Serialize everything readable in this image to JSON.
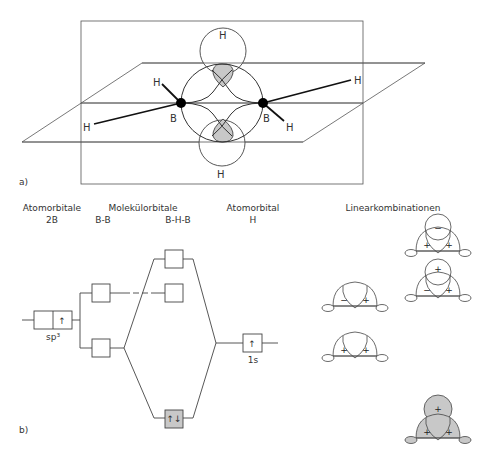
{
  "part_a": {
    "label": "a)",
    "atoms": {
      "boron_left": "B",
      "boron_right": "B",
      "h_bridge_top": "H",
      "h_bridge_bottom": "H",
      "h_terminal_left_upper": "H",
      "h_terminal_left_lower": "H",
      "h_terminal_right_upper": "H",
      "h_terminal_right_lower": "H"
    }
  },
  "part_b": {
    "label": "b)",
    "headers": {
      "atomorbitale": "Atomorbitale",
      "atomorbitale_sub": "2B",
      "molekuelorbitale": "Molekülorbitale",
      "mo_bb": "B-B",
      "mo_bhb": "B-H-B",
      "atomorbital": "Atomorbital",
      "atomorbital_sub": "H",
      "linearkombinationen": "Linearkombinationen"
    },
    "levels": {
      "sp3_label": "sp³",
      "sp3_electron": "↑",
      "h1s_label": "1s",
      "h1s_electron": "↑",
      "bhb_bonding_electrons": "↑↓"
    },
    "linear_combinations": [
      {
        "id": "antibonding-top",
        "h_sign": "−",
        "left_sign": "+",
        "right_sign": "+",
        "shaded": false
      },
      {
        "id": "nonbonding-h",
        "h_sign": "+",
        "left_sign": "−",
        "right_sign": "+",
        "shaded": false
      },
      {
        "id": "bb-antisym",
        "left_sign": "−",
        "right_sign": "+",
        "shaded": false
      },
      {
        "id": "bb-sym",
        "left_sign": "+",
        "right_sign": "+",
        "shaded": false
      },
      {
        "id": "bonding-bhb",
        "h_sign": "+",
        "left_sign": "+",
        "right_sign": "+",
        "shaded": true
      }
    ]
  },
  "colors": {
    "line": "#333333",
    "thin_line": "#555555",
    "shade": "#c8c8c8",
    "atom": "#000000"
  }
}
